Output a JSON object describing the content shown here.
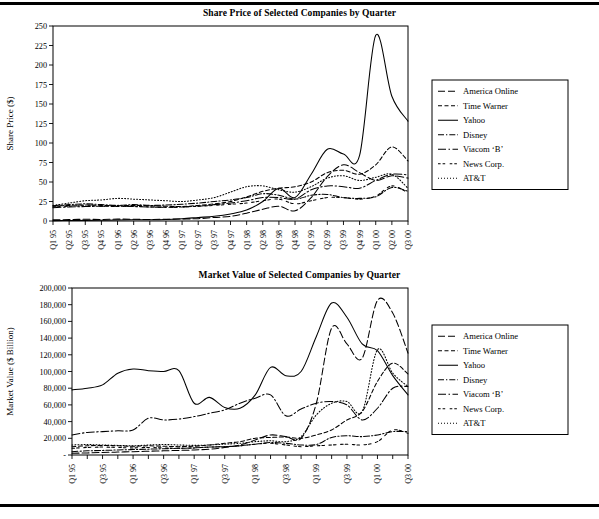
{
  "document": {
    "top_rule": true,
    "bottom_rule": true
  },
  "legend": {
    "entries": [
      {
        "label": "America Online",
        "dash": "7,3"
      },
      {
        "label": "Time Warner",
        "dash": "4,2.5"
      },
      {
        "label": "Yahoo",
        "dash": "none"
      },
      {
        "label": "Disney",
        "dash": "6,2,1.3,2"
      },
      {
        "label": "Viacom ‘B’",
        "dash": "8,2.5,1.5,2.5"
      },
      {
        "label": "News Corp.",
        "dash": "2.6,2,2.6,4.5"
      },
      {
        "label": "AT&T",
        "dash": "1,2"
      }
    ]
  },
  "chart_data": [
    {
      "id": "share-price",
      "type": "line",
      "title": "Share Price of Selected Companies by Quarter",
      "xlabel": "",
      "ylabel": "Share Price ($)",
      "ylim": [
        0,
        250
      ],
      "yticks": [
        0,
        25,
        50,
        75,
        100,
        125,
        150,
        175,
        200,
        225,
        250
      ],
      "ytick_labels": [
        "0",
        "25",
        "50",
        "75",
        "100",
        "125",
        "150",
        "175",
        "200",
        "225",
        "250"
      ],
      "grid": false,
      "legend_position": "right",
      "x": [
        "Q1 95",
        "Q2 95",
        "Q3 95",
        "Q4 95",
        "Q1 96",
        "Q2 96",
        "Q3 96",
        "Q4 96",
        "Q1 97",
        "Q2 97",
        "Q3 97",
        "Q4 97",
        "Q1 98",
        "Q2 98",
        "Q3 98",
        "Q4 98",
        "Q1 99",
        "Q2 99",
        "Q3 99",
        "Q4 99",
        "Q1 00",
        "Q2 00",
        "Q3 00"
      ],
      "xtick_labels": [
        "Q1 95",
        "Q2 95",
        "Q3 95",
        "Q4 95",
        "Q1 96",
        "Q2 96",
        "Q3 96",
        "Q4 96",
        "Q1 97",
        "Q2 97",
        "Q3 97",
        "Q4 97",
        "Q1 98",
        "Q2 98",
        "Q3 98",
        "Q4 98",
        "Q1 99",
        "Q2 99",
        "Q3 99",
        "Q4 99",
        "Q1 00",
        "Q2 00",
        "Q3 00"
      ],
      "series": [
        {
          "name": "America Online",
          "dash": "7,3",
          "values": [
            1.5,
            1.8,
            2.2,
            2.0,
            2.4,
            2.2,
            2.0,
            2.3,
            2.6,
            3.0,
            4.5,
            6.0,
            10.0,
            15.0,
            19.0,
            13.0,
            30.0,
            57.0,
            72.0,
            62.0,
            52.0,
            58.0,
            55.0
          ]
        },
        {
          "name": "Time Warner",
          "dash": "4,2.5",
          "values": [
            19.0,
            20.0,
            20.5,
            20.0,
            19.5,
            20.0,
            19.5,
            19.0,
            18.5,
            20.0,
            22.0,
            25.0,
            31.0,
            38.0,
            42.0,
            44.0,
            50.0,
            62.0,
            65.0,
            60.0,
            72.0,
            95.0,
            77.0
          ]
        },
        {
          "name": "Yahoo",
          "dash": "none",
          "values": [
            0.5,
            0.6,
            0.8,
            1.0,
            1.2,
            1.5,
            1.6,
            2.0,
            3.0,
            4.5,
            6.0,
            9.0,
            14.0,
            25.0,
            42.0,
            30.0,
            60.0,
            92.0,
            86.0,
            84.0,
            238.0,
            160.0,
            128.0
          ]
        },
        {
          "name": "Disney",
          "dash": "6,2,1.3,2",
          "values": [
            19.5,
            21.0,
            22.0,
            21.0,
            20.0,
            21.0,
            20.0,
            20.5,
            21.5,
            23.0,
            25.0,
            27.0,
            30.0,
            35.0,
            33.0,
            28.0,
            33.0,
            34.0,
            30.0,
            29.0,
            31.0,
            43.0,
            38.0
          ]
        },
        {
          "name": "Viacom ‘B’",
          "dash": "8,2.5,1.5,2.5",
          "values": [
            17.0,
            18.0,
            18.5,
            19.0,
            19.0,
            18.5,
            18.0,
            17.5,
            18.0,
            19.0,
            21.0,
            23.0,
            26.0,
            30.0,
            30.0,
            28.0,
            40.0,
            45.0,
            44.0,
            42.0,
            52.0,
            60.0,
            59.0
          ]
        },
        {
          "name": "News Corp.",
          "dash": "2.6,2,2.6,4.5",
          "values": [
            18.0,
            19.0,
            19.5,
            19.0,
            18.5,
            19.0,
            18.0,
            17.5,
            18.0,
            19.0,
            20.0,
            21.5,
            23.0,
            26.0,
            28.0,
            22.0,
            26.0,
            30.0,
            30.0,
            28.0,
            32.0,
            45.0,
            36.0
          ]
        },
        {
          "name": "AT&T",
          "dash": "1,2",
          "values": [
            20.0,
            23.0,
            26.0,
            27.0,
            29.0,
            28.0,
            27.0,
            26.0,
            25.0,
            27.0,
            30.0,
            37.0,
            44.0,
            45.0,
            40.0,
            37.0,
            44.0,
            55.0,
            58.0,
            52.0,
            56.0,
            60.0,
            42.0
          ]
        }
      ]
    },
    {
      "id": "market-value",
      "type": "line",
      "title": "Market Value of Selected Companies by Quarter",
      "xlabel": "",
      "ylabel": "Market Value ($ Billion)",
      "ylim": [
        0,
        200000
      ],
      "yticks": [
        0,
        20000,
        40000,
        60000,
        80000,
        100000,
        120000,
        140000,
        160000,
        180000,
        200000
      ],
      "ytick_labels": [
        "-",
        "20,000",
        "40,000",
        "60,000",
        "80,000",
        "100,000",
        "120,000",
        "140,000",
        "160,000",
        "180,000",
        "200,000"
      ],
      "grid": false,
      "legend_position": "right",
      "x": [
        "Q1 95",
        "Q2 95",
        "Q3 95",
        "Q4 95",
        "Q1 96",
        "Q2 96",
        "Q3 96",
        "Q4 96",
        "Q1 97",
        "Q2 97",
        "Q3 97",
        "Q4 97",
        "Q1 98",
        "Q2 98",
        "Q3 98",
        "Q4 98",
        "Q1 99",
        "Q2 99",
        "Q3 99",
        "Q4 99",
        "Q1 00",
        "Q2 00",
        "Q3 00"
      ],
      "xtick_labels": [
        "Q1 95",
        "",
        "Q3 95",
        "",
        "Q1 96",
        "",
        "Q3 96",
        "",
        "Q1 97",
        "",
        "Q3 97",
        "",
        "Q1 98",
        "",
        "Q3 98",
        "",
        "Q1 99",
        "",
        "Q3 99",
        "",
        "Q1 00",
        "",
        "Q3 00"
      ],
      "series": [
        {
          "name": "America Online",
          "dash": "7,3",
          "values": [
            2000,
            2500,
            3000,
            3500,
            4000,
            4500,
            5000,
            5500,
            6000,
            7000,
            9000,
            12000,
            18000,
            24000,
            22000,
            20000,
            62000,
            152000,
            133000,
            116000,
            185000,
            170000,
            122000
          ]
        },
        {
          "name": "Time Warner",
          "dash": "4,2.5",
          "values": [
            10000,
            11000,
            11500,
            11000,
            10500,
            11000,
            10500,
            10000,
            10500,
            12000,
            14000,
            16000,
            20000,
            21000,
            21500,
            20000,
            24000,
            30000,
            42000,
            52000,
            88000,
            110000,
            97000
          ]
        },
        {
          "name": "Yahoo",
          "dash": "none",
          "values": [
            78000,
            80000,
            84000,
            98000,
            103000,
            101000,
            100000,
            101000,
            62000,
            69000,
            57000,
            56000,
            72000,
            105000,
            95000,
            100000,
            142000,
            182000,
            165000,
            133000,
            125000,
            95000,
            72000
          ]
        },
        {
          "name": "Disney",
          "dash": "6,2,1.3,2",
          "values": [
            4000,
            5000,
            5500,
            6000,
            6500,
            7000,
            7500,
            8000,
            8500,
            9500,
            10000,
            11000,
            13000,
            15000,
            14000,
            12000,
            12500,
            21000,
            23000,
            22000,
            24000,
            28000,
            28000
          ]
        },
        {
          "name": "Viacom ‘B’",
          "dash": "8,2.5,1.5,2.5",
          "values": [
            24000,
            27000,
            28000,
            29000,
            30000,
            44000,
            42000,
            43000,
            46000,
            50000,
            54000,
            62000,
            68000,
            72000,
            47000,
            55000,
            62000,
            64000,
            60000,
            42000,
            56000,
            80000,
            82000
          ]
        },
        {
          "name": "News Corp.",
          "dash": "2.6,2,2.6,4.5",
          "values": [
            8000,
            9000,
            9500,
            9000,
            8500,
            9000,
            8500,
            8000,
            8500,
            9500,
            10000,
            11000,
            13000,
            14000,
            12000,
            10000,
            11000,
            12000,
            13000,
            12000,
            16000,
            30000,
            26000
          ]
        },
        {
          "name": "AT&T",
          "dash": "1,2",
          "values": [
            12000,
            12500,
            12000,
            11500,
            11000,
            12000,
            12500,
            12000,
            11500,
            12000,
            13000,
            14000,
            16000,
            17000,
            16000,
            22000,
            48000,
            62000,
            64000,
            52000,
            126000,
            98000,
            82000
          ]
        }
      ]
    }
  ]
}
